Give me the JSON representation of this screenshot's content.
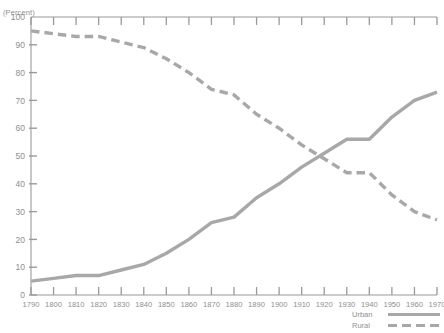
{
  "axis_unit_label": "(Percent)",
  "legend": {
    "entries": [
      {
        "label": "Urban",
        "style": "solid",
        "color": "#a8a8a8"
      },
      {
        "label": "Rural",
        "style": "dashed",
        "color": "#a8a8a8"
      }
    ]
  },
  "colors": {
    "line": "#a8a8a8",
    "axis": "#9a9a9a",
    "text": "#8f8f8f",
    "background": "#ffffff"
  },
  "chart_data": {
    "type": "line",
    "title": "",
    "subtitle": "",
    "xlabel": "",
    "ylabel": "(Percent)",
    "xlim": [
      1790,
      1970
    ],
    "ylim": [
      0,
      100
    ],
    "grid": false,
    "legend_position": "bottom-right",
    "x": [
      1790,
      1800,
      1810,
      1820,
      1830,
      1840,
      1850,
      1860,
      1870,
      1880,
      1890,
      1900,
      1910,
      1920,
      1930,
      1940,
      1950,
      1960,
      1970
    ],
    "xticklabels": [
      "1790",
      "1800",
      "1810",
      "1820",
      "1830",
      "1840",
      "1850",
      "1860",
      "1870",
      "1880",
      "1890",
      "1900",
      "1910",
      "1920",
      "1930",
      "1940",
      "1950",
      "1960",
      "1970"
    ],
    "yticks": [
      0,
      10,
      20,
      30,
      40,
      50,
      60,
      70,
      80,
      90,
      100
    ],
    "yticklabels": [
      "0",
      "10",
      "20",
      "30",
      "40",
      "50",
      "60",
      "70",
      "80",
      "90",
      "100"
    ],
    "series": [
      {
        "name": "Urban",
        "style": "solid",
        "color": "#a8a8a8",
        "values": [
          5,
          6,
          7,
          7,
          9,
          11,
          15,
          20,
          26,
          28,
          35,
          40,
          46,
          51,
          56,
          56,
          64,
          70,
          73
        ]
      },
      {
        "name": "Rural",
        "style": "dashed",
        "color": "#a8a8a8",
        "values": [
          95,
          94,
          93,
          93,
          91,
          89,
          85,
          80,
          74,
          72,
          65,
          60,
          54,
          49,
          44,
          44,
          36,
          30,
          27
        ]
      }
    ]
  }
}
